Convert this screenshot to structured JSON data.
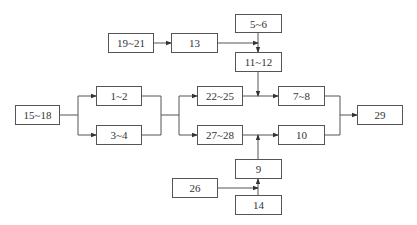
{
  "diagram": {
    "type": "flow-network",
    "nodes": [
      {
        "id": "n15_18",
        "label": "15~18",
        "x": 15,
        "y": 105,
        "w": 45,
        "h": 20
      },
      {
        "id": "n1_2",
        "label": "1~2",
        "x": 96,
        "y": 86,
        "w": 46,
        "h": 20
      },
      {
        "id": "n3_4",
        "label": "3~4",
        "x": 96,
        "y": 125,
        "w": 46,
        "h": 20
      },
      {
        "id": "n19_21",
        "label": "19~21",
        "x": 108,
        "y": 33,
        "w": 46,
        "h": 20
      },
      {
        "id": "n13",
        "label": "13",
        "x": 171,
        "y": 33,
        "w": 47,
        "h": 20
      },
      {
        "id": "n5_6",
        "label": "5~6",
        "x": 235,
        "y": 14,
        "w": 47,
        "h": 19
      },
      {
        "id": "n11_12",
        "label": "11~12",
        "x": 235,
        "y": 52,
        "w": 47,
        "h": 20
      },
      {
        "id": "n22_25",
        "label": "22~25",
        "x": 197,
        "y": 86,
        "w": 46,
        "h": 20
      },
      {
        "id": "n27_28",
        "label": "27~28",
        "x": 197,
        "y": 125,
        "w": 46,
        "h": 20
      },
      {
        "id": "n7_8",
        "label": "7~8",
        "x": 278,
        "y": 86,
        "w": 47,
        "h": 20
      },
      {
        "id": "n10",
        "label": "10",
        "x": 278,
        "y": 125,
        "w": 47,
        "h": 20
      },
      {
        "id": "n29",
        "label": "29",
        "x": 357,
        "y": 105,
        "w": 46,
        "h": 20
      },
      {
        "id": "n9",
        "label": "9",
        "x": 235,
        "y": 159,
        "w": 47,
        "h": 20
      },
      {
        "id": "n26",
        "label": "26",
        "x": 172,
        "y": 178,
        "w": 46,
        "h": 20
      },
      {
        "id": "n14",
        "label": "14",
        "x": 235,
        "y": 195,
        "w": 47,
        "h": 20
      }
    ],
    "edges": [
      {
        "from": "15~18",
        "to": "1~2"
      },
      {
        "from": "15~18",
        "to": "3~4"
      },
      {
        "from": "1~2",
        "to": "22~25"
      },
      {
        "from": "1~2",
        "to": "27~28"
      },
      {
        "from": "3~4",
        "to": "22~25"
      },
      {
        "from": "3~4",
        "to": "27~28"
      },
      {
        "from": "19~21",
        "to": "13"
      },
      {
        "from": "13",
        "to": "11~12"
      },
      {
        "from": "5~6",
        "to": "11~12"
      },
      {
        "from": "11~12",
        "to": "7~8"
      },
      {
        "from": "22~25",
        "to": "7~8"
      },
      {
        "from": "27~28",
        "to": "10"
      },
      {
        "from": "9",
        "to": "10"
      },
      {
        "from": "26",
        "to": "9"
      },
      {
        "from": "14",
        "to": "9"
      },
      {
        "from": "7~8",
        "to": "29"
      },
      {
        "from": "10",
        "to": "29"
      }
    ]
  }
}
